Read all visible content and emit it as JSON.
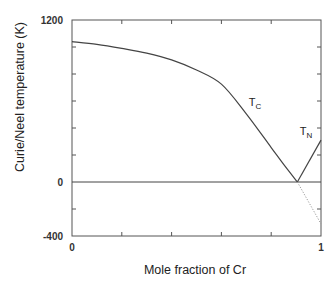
{
  "chart_data": {
    "type": "line",
    "title": "",
    "xlabel": "Mole fraction of Cr",
    "ylabel": "Curie/Neel temperature (K)",
    "xlim": [
      0,
      1
    ],
    "ylim": [
      -400,
      1200
    ],
    "x_tick_labels": [
      {
        "value": 0,
        "label": "0"
      },
      {
        "value": 1,
        "label": "1"
      }
    ],
    "x_minor_ticks": [
      0.2,
      0.4,
      0.6,
      0.8
    ],
    "y_tick_labels": [
      {
        "value": 1200,
        "label": "1200"
      },
      {
        "value": 0,
        "label": "0"
      },
      {
        "value": -400,
        "label": "-400"
      }
    ],
    "y_minor_ticks": [
      1000,
      800,
      600,
      400,
      200,
      -200
    ],
    "grid": false,
    "legend": "none",
    "zero_line": true,
    "series": [
      {
        "name": "T_C",
        "label_main": "T",
        "label_sub": "C",
        "style": "solid",
        "x": [
          0,
          0.1,
          0.2,
          0.3,
          0.4,
          0.5,
          0.6,
          0.7,
          0.8,
          0.85,
          0.905
        ],
        "y": [
          1040,
          1020,
          990,
          955,
          905,
          830,
          725,
          505,
          255,
          130,
          0
        ],
        "label_pos": {
          "x": 0.71,
          "y": 560
        }
      },
      {
        "name": "T_N",
        "label_main": "T",
        "label_sub": "N",
        "style": "solid",
        "x": [
          0.905,
          1.0
        ],
        "y": [
          0,
          310
        ],
        "label_pos": {
          "x": 0.915,
          "y": 350
        }
      },
      {
        "name": "T_C extrapolation",
        "style": "dotted",
        "x": [
          0.905,
          1.0
        ],
        "y": [
          0,
          -310
        ]
      }
    ]
  }
}
